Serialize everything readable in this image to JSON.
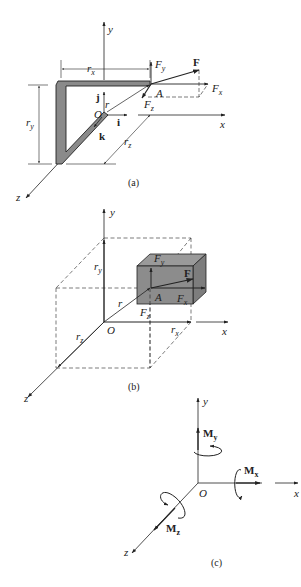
{
  "figure": {
    "panels": [
      {
        "id": "a",
        "caption": "(a)",
        "labels": {
          "y_axis": "y",
          "x_axis": "x",
          "z_axis": "z",
          "origin": "O",
          "point": "A",
          "force": "F",
          "fx": "F",
          "fx_sub": "x",
          "fy": "F",
          "fy_sub": "y",
          "fz": "F",
          "fz_sub": "z",
          "rx": "r",
          "rx_sub": "x",
          "ry": "r",
          "ry_sub": "y",
          "rz": "r",
          "rz_sub": "z",
          "r": "r",
          "i": "i",
          "j": "j",
          "k": "k"
        }
      },
      {
        "id": "b",
        "caption": "(b)",
        "labels": {
          "y_axis": "y",
          "x_axis": "x",
          "z_axis": "z",
          "origin": "O",
          "point": "A",
          "force": "F",
          "fx": "F",
          "fx_sub": "x",
          "fy": "F",
          "fy_sub": "y",
          "fz": "F",
          "fz_sub": "z",
          "rx": "r",
          "rx_sub": "x",
          "ry": "r",
          "ry_sub": "y",
          "rz": "r",
          "rz_sub": "z",
          "r": "r"
        }
      },
      {
        "id": "c",
        "caption": "(c)",
        "labels": {
          "y_axis": "y",
          "x_axis": "x",
          "z_axis": "z",
          "origin": "O",
          "mx": "M",
          "mx_sub": "x",
          "my": "M",
          "my_sub": "y",
          "mz": "M",
          "mz_sub": "z"
        }
      }
    ],
    "colors": {
      "ink": "#222222",
      "member_fill": "#8a8a8a",
      "box_fill": "#8c8c8c",
      "box_top": "#9a9a9a"
    }
  }
}
